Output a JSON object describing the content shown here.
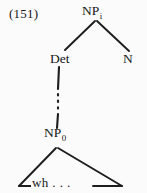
{
  "figure": {
    "example_number": "(151)",
    "caption_text": "",
    "background_color": "#fbfbfc",
    "ink_color": "#1a1a1a"
  },
  "tree": {
    "nodes": [
      {
        "id": "np-i",
        "base_label": "NP",
        "subscript": "i",
        "full_label": "NPᵢ",
        "role": "root-noun-phrase",
        "x": 96,
        "y": 11
      },
      {
        "id": "det",
        "base_label": "Det",
        "subscript": "",
        "full_label": "Det",
        "role": "determiner",
        "x": 62,
        "y": 59
      },
      {
        "id": "n",
        "base_label": "N",
        "subscript": "",
        "full_label": "N",
        "role": "noun-head",
        "x": 129,
        "y": 59
      },
      {
        "id": "np-0",
        "base_label": "NP",
        "subscript": "0",
        "full_label": "NP₀",
        "role": "embedded-noun-phrase",
        "x": 57,
        "y": 133
      }
    ],
    "terminal": {
      "id": "wh-terminal",
      "label": "wh . . .",
      "text": "wh",
      "ellipsis": ". . ."
    },
    "branches": [
      {
        "id": "np-i-to-det",
        "from": "np-i",
        "to": "det",
        "style": "solid"
      },
      {
        "id": "np-i-to-n",
        "from": "np-i",
        "to": "n",
        "style": "solid"
      },
      {
        "id": "det-to-np-0",
        "from": "det",
        "to": "np-0",
        "style": "dotted-segmented"
      }
    ],
    "triangle": {
      "id": "wh-triangle",
      "apex_node": "np-0",
      "label": "wh . . .",
      "meaning": "unexpanded-constituent"
    }
  }
}
